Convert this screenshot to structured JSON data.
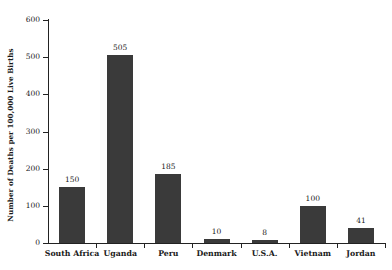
{
  "chart_data": {
    "type": "bar",
    "title": "",
    "subtitle": "",
    "xlabel": "",
    "ylabel": "Number of Deaths per 100,000 Live Births",
    "categories": [
      "South Africa",
      "Uganda",
      "Peru",
      "Denmark",
      "U.S.A.",
      "Vietnam",
      "Jordan"
    ],
    "values": [
      150,
      505,
      185,
      10,
      8,
      100,
      41
    ],
    "value_labels": [
      "150",
      "505",
      "185",
      "10",
      "8",
      "100",
      "41"
    ],
    "ylim": [
      0,
      600
    ],
    "yticks": [
      0,
      100,
      200,
      300,
      400,
      500,
      600
    ],
    "ytick_labels": [
      "0",
      "100",
      "200",
      "300",
      "400",
      "500",
      "600"
    ],
    "grid": false,
    "legend": false,
    "legend_position": "none",
    "bar_color": "#3a3a3a",
    "axis_color": "#222222",
    "background_color": "#ffffff",
    "annotations": []
  }
}
